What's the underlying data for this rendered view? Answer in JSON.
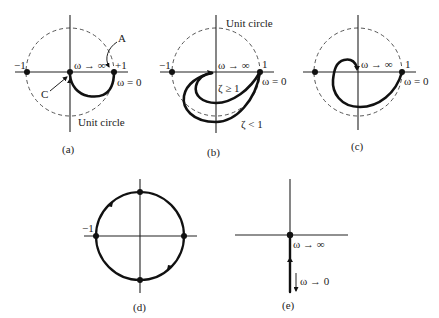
{
  "figure": {
    "panels": [
      {
        "id": "a",
        "caption": "(a)",
        "labels": {
          "minus_one": "−1",
          "plus_one": "+1",
          "omega_inf": "ω → ∞",
          "omega_zero": "ω = 0",
          "point_a": "A",
          "point_c": "C",
          "unit_circle": "Unit circle"
        }
      },
      {
        "id": "b",
        "caption": "(b)",
        "labels": {
          "minus_one": "−1",
          "one": "1",
          "omega_inf": "ω → ∞",
          "omega_zero": "ω = 0",
          "zeta_ge_1": "ζ ≥ 1",
          "zeta_lt_1": "ζ < 1",
          "unit_circle": "Unit circle"
        }
      },
      {
        "id": "c",
        "caption": "(c)",
        "labels": {
          "one": "1",
          "omega_inf": "ω → ∞",
          "omega_zero": "ω = 0"
        }
      },
      {
        "id": "d",
        "caption": "(d)",
        "labels": {
          "minus_one": "−1"
        }
      },
      {
        "id": "e",
        "caption": "(e)",
        "labels": {
          "omega_inf": "ω → ∞",
          "omega_zero": "ω → 0"
        }
      }
    ]
  }
}
